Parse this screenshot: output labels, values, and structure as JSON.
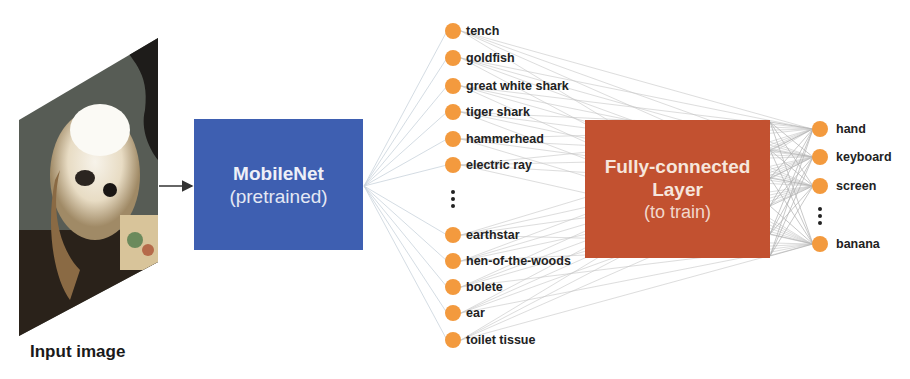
{
  "input": {
    "label": "Input image",
    "image_description": "photo of a white fluffy dog next to a cup"
  },
  "backbone": {
    "title": "MobileNet",
    "subtitle": "(pretrained)",
    "color": "#3e5fb1"
  },
  "head": {
    "title_line1": "Fully-connected",
    "title_line2": "Layer",
    "subtitle": "(to train)",
    "color": "#c25130"
  },
  "node_color": "#f39a3e",
  "imagenet_classes": {
    "top": [
      "tench",
      "goldfish",
      "great white shark",
      "tiger shark",
      "hammerhead",
      "electric ray"
    ],
    "bottom": [
      "earthstar",
      "hen-of-the-woods",
      "bolete",
      "ear",
      "toilet tissue"
    ],
    "ellipsis": "⋮"
  },
  "output_classes": {
    "top": [
      "hand",
      "keyboard",
      "screen"
    ],
    "bottom": [
      "banana"
    ],
    "ellipsis": "⋮"
  }
}
